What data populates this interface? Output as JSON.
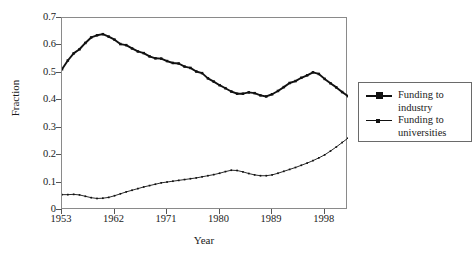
{
  "chart_data": {
    "type": "line",
    "title": "",
    "xlabel": "Year",
    "ylabel": "Fraction",
    "xlim": [
      1953,
      2002
    ],
    "ylim": [
      0,
      0.7
    ],
    "grid": false,
    "legend_position": "right-outside",
    "xticks": [
      "1953",
      "1962",
      "1971",
      "1980",
      "1989",
      "1998"
    ],
    "xtick_values": [
      1953,
      1962,
      1971,
      1980,
      1989,
      1998
    ],
    "yticks": [
      "0",
      "0.1",
      "0.2",
      "0.3",
      "0.4",
      "0.5",
      "0.6",
      "0.7"
    ],
    "ytick_values": [
      0,
      0.1,
      0.2,
      0.3,
      0.4,
      0.5,
      0.6,
      0.7
    ],
    "x": [
      1953,
      1954,
      1955,
      1956,
      1957,
      1958,
      1959,
      1960,
      1961,
      1962,
      1963,
      1964,
      1965,
      1966,
      1967,
      1968,
      1969,
      1970,
      1971,
      1972,
      1973,
      1974,
      1975,
      1976,
      1977,
      1978,
      1979,
      1980,
      1981,
      1982,
      1983,
      1984,
      1985,
      1986,
      1987,
      1988,
      1989,
      1990,
      1991,
      1992,
      1993,
      1994,
      1995,
      1996,
      1997,
      1998,
      1999,
      2000,
      2001,
      2002
    ],
    "series": [
      {
        "name": "Funding to industry",
        "marker": "square",
        "linewidth": "thick",
        "color": "#111111",
        "values": [
          0.513,
          0.545,
          0.571,
          0.586,
          0.609,
          0.629,
          0.637,
          0.641,
          0.632,
          0.621,
          0.605,
          0.601,
          0.589,
          0.578,
          0.572,
          0.56,
          0.553,
          0.552,
          0.543,
          0.536,
          0.534,
          0.523,
          0.518,
          0.505,
          0.499,
          0.48,
          0.468,
          0.455,
          0.444,
          0.432,
          0.424,
          0.424,
          0.429,
          0.426,
          0.418,
          0.414,
          0.422,
          0.434,
          0.448,
          0.463,
          0.47,
          0.482,
          0.491,
          0.502,
          0.496,
          0.478,
          0.462,
          0.447,
          0.43,
          0.415
        ]
      },
      {
        "name": "Funding to universities",
        "marker": "square-small",
        "linewidth": "thin",
        "color": "#111111",
        "values": [
          0.056,
          0.056,
          0.057,
          0.055,
          0.05,
          0.045,
          0.042,
          0.043,
          0.046,
          0.052,
          0.059,
          0.066,
          0.072,
          0.078,
          0.084,
          0.089,
          0.094,
          0.099,
          0.102,
          0.105,
          0.108,
          0.111,
          0.114,
          0.117,
          0.121,
          0.125,
          0.129,
          0.134,
          0.14,
          0.145,
          0.144,
          0.139,
          0.133,
          0.128,
          0.125,
          0.125,
          0.128,
          0.134,
          0.141,
          0.148,
          0.155,
          0.163,
          0.171,
          0.18,
          0.19,
          0.201,
          0.215,
          0.23,
          0.246,
          0.262
        ]
      }
    ]
  },
  "legend": {
    "items": [
      {
        "label": "Funding to\nindustry"
      },
      {
        "label": "Funding to\nuniversities"
      }
    ]
  },
  "axes": {
    "y_title": "Fraction",
    "x_title": "Year"
  }
}
